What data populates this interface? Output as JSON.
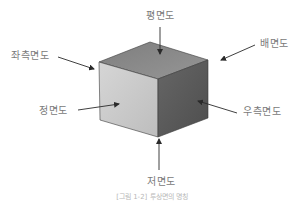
{
  "diagram": {
    "type": "isometric cube with six orthographic view labels",
    "colors": {
      "top_face": "#8a8a8a",
      "front_face": "#c9c9c9",
      "right_face": "#5a5a5a",
      "edge": "#3a3a3a",
      "arrow": "#2a2a2a",
      "label_text": "#7a7a7a"
    },
    "labels": {
      "top": "평면도",
      "back": "배면도",
      "left_side": "좌측면도",
      "front": "정면도",
      "right_side": "우측면도",
      "bottom": "저면도"
    },
    "caption": "[그림 1-2] 투상면의 명칭"
  }
}
